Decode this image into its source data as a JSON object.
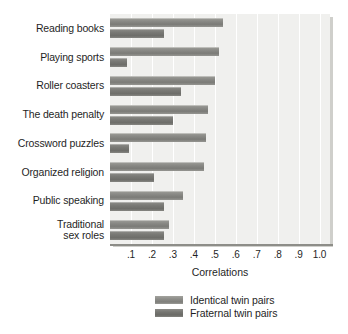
{
  "chart_data": {
    "type": "bar",
    "orientation": "horizontal",
    "title": "",
    "xlabel": "Correlations",
    "ylabel": "",
    "xlim": [
      0,
      1.05
    ],
    "grid": true,
    "legend_position": "bottom",
    "xticks": [
      ".1",
      ".2",
      ".3",
      ".4",
      ".5",
      ".6",
      ".7",
      ".8",
      ".9",
      "1.0"
    ],
    "xtick_values": [
      0.1,
      0.2,
      0.3,
      0.4,
      0.5,
      0.6,
      0.7,
      0.8,
      0.9,
      1.0
    ],
    "categories": [
      "Reading books",
      "Playing sports",
      "Roller coasters",
      "The death penalty",
      "Crossword puzzles",
      "Organized religion",
      "Public speaking",
      "Traditional\nsex roles"
    ],
    "series": [
      {
        "name": "Identical twin pairs",
        "values": [
          0.54,
          0.52,
          0.5,
          0.47,
          0.46,
          0.45,
          0.35,
          0.28
        ]
      },
      {
        "name": "Fraternal twin pairs",
        "values": [
          0.26,
          0.08,
          0.34,
          0.3,
          0.09,
          0.21,
          0.26,
          0.26
        ]
      }
    ]
  },
  "legend": {
    "items": [
      {
        "label": "Identical twin pairs",
        "swatch": "identical"
      },
      {
        "label": "Fraternal twin pairs",
        "swatch": "fraternal"
      }
    ]
  },
  "colors": {
    "plot_background": "#f0f0ee",
    "gridline": "#ffffff",
    "identical_bar": "#8a8a86",
    "fraternal_bar": "#787874",
    "axis": "#8d8d88",
    "text": "#1f1f1f"
  }
}
